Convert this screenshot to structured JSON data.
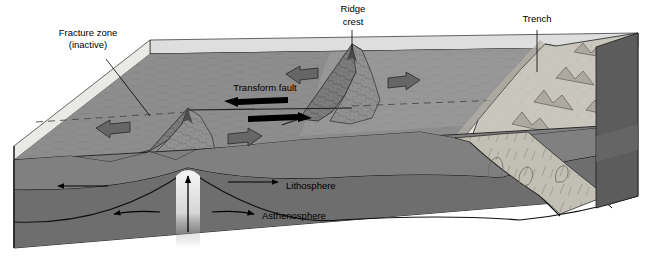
{
  "figure": {
    "type": "geological-block-diagram"
  },
  "labels": {
    "fracture_zone_line1": "Fracture zone",
    "fracture_zone_line2": "(inactive)",
    "ridge_crest_line1": "Ridge",
    "ridge_crest_line2": "crest",
    "trench": "Trench",
    "transform_fault": "Transform fault",
    "lithosphere": "Lithosphere",
    "asthenosphere": "Asthenosphere"
  },
  "colors": {
    "water_surface": "#d9d9d6",
    "seafloor_west": "#8a8a8a",
    "seafloor_east": "#9a9a9a",
    "ridge_flank": "#7b7b7b",
    "lithosphere": "#7f7f7f",
    "asthenosphere": "#6e6e6e",
    "deep_mantle": "#5e5e5e",
    "continent": "#c9c6bd",
    "continent_shadow": "#a8a49a",
    "side_face": "#545454",
    "block_arrow": "#6a6a6a",
    "outline": "#1a1a1a",
    "plume": "#f2f2f2",
    "label_text": "#000000"
  },
  "features": {
    "spreading_arrows": [
      {
        "name": "west-arrow-south-segment",
        "direction": "left"
      },
      {
        "name": "east-arrow-south-segment",
        "direction": "right"
      },
      {
        "name": "west-arrow-north-segment",
        "direction": "left"
      },
      {
        "name": "east-arrow-north-segment",
        "direction": "right"
      }
    ],
    "transform_arrows": [
      {
        "name": "transform-arrow-left",
        "direction": "left"
      },
      {
        "name": "transform-arrow-right",
        "direction": "right"
      }
    ],
    "mantle_arrows": [
      {
        "name": "lithosphere-arrow-west",
        "direction": "left"
      },
      {
        "name": "lithosphere-arrow-east",
        "direction": "right"
      },
      {
        "name": "convection-arrow-west",
        "direction": "left"
      },
      {
        "name": "convection-arrow-east",
        "direction": "right"
      },
      {
        "name": "upwelling-plume-arrow",
        "direction": "up"
      }
    ]
  }
}
